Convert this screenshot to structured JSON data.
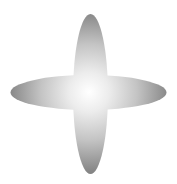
{
  "figure": {
    "shape": "four-pointed-star",
    "colors": {
      "center": "#ffffff",
      "mid": "#d6d6d6",
      "edge": "#8c8c8c",
      "background": "#ffffff"
    }
  }
}
